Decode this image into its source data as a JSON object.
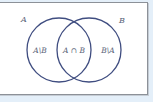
{
  "diagram": {
    "type": "venn",
    "sets": [
      {
        "id": "A",
        "label": "A",
        "cx": 59,
        "cy": 50,
        "r": 32
      },
      {
        "id": "B",
        "label": "B",
        "cx": 89,
        "cy": 50,
        "r": 32
      }
    ],
    "regions": [
      {
        "id": "a-minus-b",
        "label": "A\\B",
        "x": 40,
        "y": 53
      },
      {
        "id": "a-intersect-b",
        "label": "A ∩ B",
        "x": 74,
        "y": 53
      },
      {
        "id": "b-minus-a",
        "label": "B\\A",
        "x": 108,
        "y": 53
      }
    ],
    "set_label_positions": {
      "A": {
        "x": 24,
        "y": 22
      },
      "B": {
        "x": 122,
        "y": 23
      }
    },
    "colors": {
      "circle_stroke": "#3f4d80",
      "text": "#5a6478",
      "frame_border": "#8c9198",
      "frame_fill": "#ffffff",
      "outer_background": "#e4eff9"
    }
  }
}
